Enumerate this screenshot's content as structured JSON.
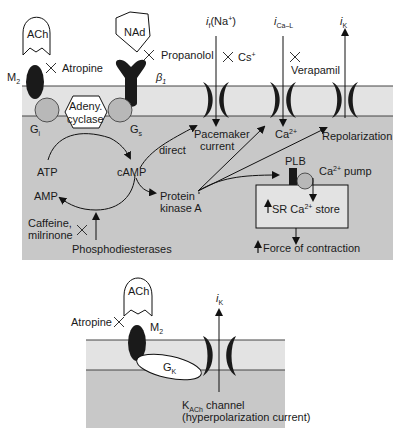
{
  "top_panel": {
    "ach_label": "ACh",
    "nad_label": "NAd",
    "m2_label": "M",
    "m2_sub": "2",
    "beta_label": "β",
    "beta_sub": "1",
    "atropine": "Atropine",
    "propanolol": "Propanolol",
    "cs": "Cs",
    "cs_sup": "+",
    "verapamil": "Verapamil",
    "adenyl_line1": "Adeny.",
    "adenyl_line2": "cyclase",
    "gi_label": "G",
    "gi_sub": "i",
    "gs_label": "G",
    "gs_sub": "s",
    "if_label": "i",
    "if_sub": "f",
    "if_ion": "(Na",
    "if_ion_sup": "+",
    "if_close": ")",
    "ica_label": "i",
    "ica_sub": "Ca–L",
    "ik_label": "i",
    "ik_sub": "K",
    "atp": "ATP",
    "camp": "cAMP",
    "amp": "AMP",
    "direct": "direct",
    "pka_line1": "Protein",
    "pka_line2": "kinase A",
    "caffeine_line1": "Caffeine,",
    "caffeine_line2": "milrinone",
    "phosphodiesterases": "Phosphodiesterases",
    "pacemaker_line1": "Pacemaker",
    "pacemaker_line2": "current",
    "ca_label": "Ca",
    "ca_sup": "2+",
    "repolarization": "Repolarization",
    "plb": "PLB",
    "ca_pump": "Ca",
    "ca_pump_sup": "2+",
    "ca_pump_word": " pump",
    "sr_store": "SR Ca",
    "sr_store_sup": "2+",
    "sr_store_word": " store",
    "force": "Force of contraction"
  },
  "bottom_panel": {
    "ach_label": "ACh",
    "atropine": "Atropine",
    "m2_label": "M",
    "m2_sub": "2",
    "gk_label": "G",
    "gk_sub": "K",
    "ik_label": "i",
    "ik_sub": "K",
    "kach_label": "K",
    "kach_sub": "ACh",
    "kach_word": " channel",
    "kach_line2": "(hyperpolarization current)"
  },
  "colors": {
    "membrane": "#e3e3e3",
    "cytoplasm": "#c8c8c8",
    "protein_dark": "#1a1a1a",
    "g_protein": "#b8b8b8"
  }
}
